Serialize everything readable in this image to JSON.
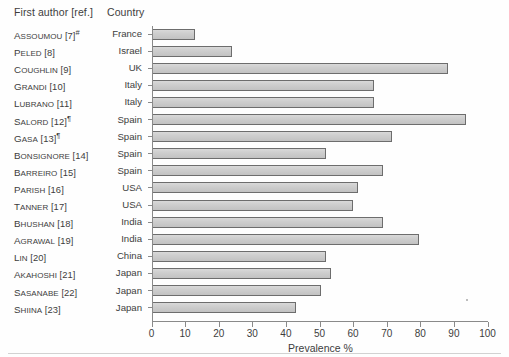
{
  "header": {
    "author_column": "First author [ref.]",
    "country_column": "Country"
  },
  "chart_data": {
    "type": "bar",
    "orientation": "horizontal",
    "title": "",
    "xlabel": "Prevalence %",
    "ylabel": "",
    "xlim": [
      0,
      100
    ],
    "xticks": [
      "0",
      "10",
      "20",
      "30",
      "40",
      "50",
      "60",
      "70",
      "80",
      "90",
      "100"
    ],
    "grid": false,
    "legend": false,
    "bar_fill": "#cfcfcf",
    "bar_border": "#6d6d6d",
    "categories": [
      "Assoumou [7]#",
      "Peled [8]",
      "Coughlin [9]",
      "Grandi [10]",
      "Lubrano [11]",
      "Salord [12]¶",
      "Gasa [13]¶",
      "Bonsignore [14]",
      "Barreiro [15]",
      "Parish [16]",
      "Tanner [17]",
      "Bhushan [18]",
      "Agrawal [19]",
      "Lin [20]",
      "Akahoshi [21]",
      "Sasanabe [22]",
      "Shiina [23]"
    ],
    "values": [
      12.7,
      23.7,
      88.0,
      66.0,
      66.0,
      93.5,
      71.4,
      51.7,
      68.8,
      61.2,
      59.7,
      68.8,
      79.6,
      51.7,
      53.4,
      50.2,
      43.0
    ]
  },
  "rows": [
    {
      "name_first": "A",
      "name_rest": "SSOUMOU",
      "ref": " [7]",
      "sup": "#",
      "country": "France",
      "value": 12.7
    },
    {
      "name_first": "P",
      "name_rest": "ELED",
      "ref": " [8]",
      "sup": "",
      "country": "Israel",
      "value": 23.7
    },
    {
      "name_first": "C",
      "name_rest": "OUGHLIN",
      "ref": " [9]",
      "sup": "",
      "country": "UK",
      "value": 88.0
    },
    {
      "name_first": "G",
      "name_rest": "RANDI",
      "ref": " [10]",
      "sup": "",
      "country": "Italy",
      "value": 66.0
    },
    {
      "name_first": "L",
      "name_rest": "UBRANO",
      "ref": " [11]",
      "sup": "",
      "country": "Italy",
      "value": 66.0
    },
    {
      "name_first": "S",
      "name_rest": "ALORD",
      "ref": " [12]",
      "sup": "¶",
      "country": "Spain",
      "value": 93.5
    },
    {
      "name_first": "G",
      "name_rest": "ASA",
      "ref": " [13]",
      "sup": "¶",
      "country": "Spain",
      "value": 71.4
    },
    {
      "name_first": "B",
      "name_rest": "ONSIGNORE",
      "ref": " [14]",
      "sup": "",
      "country": "Spain",
      "value": 51.7
    },
    {
      "name_first": "B",
      "name_rest": "ARREIRO",
      "ref": " [15]",
      "sup": "",
      "country": "Spain",
      "value": 68.8
    },
    {
      "name_first": "P",
      "name_rest": "ARISH",
      "ref": " [16]",
      "sup": "",
      "country": "USA",
      "value": 61.2
    },
    {
      "name_first": "T",
      "name_rest": "ANNER",
      "ref": " [17]",
      "sup": "",
      "country": "USA",
      "value": 59.7
    },
    {
      "name_first": "B",
      "name_rest": "HUSHAN",
      "ref": " [18]",
      "sup": "",
      "country": "India",
      "value": 68.8
    },
    {
      "name_first": "A",
      "name_rest": "GRAWAL",
      "ref": " [19]",
      "sup": "",
      "country": "India",
      "value": 79.6
    },
    {
      "name_first": "L",
      "name_rest": "IN",
      "ref": " [20]",
      "sup": "",
      "country": "China",
      "value": 51.7
    },
    {
      "name_first": "A",
      "name_rest": "KAHOSHI",
      "ref": " [21]",
      "sup": "",
      "country": "Japan",
      "value": 53.4
    },
    {
      "name_first": "S",
      "name_rest": "ASANABE",
      "ref": " [22]",
      "sup": "",
      "country": "Japan",
      "value": 50.2
    },
    {
      "name_first": "S",
      "name_rest": "HIINA",
      "ref": " [23]",
      "sup": "",
      "country": "Japan",
      "value": 43.0
    }
  ]
}
